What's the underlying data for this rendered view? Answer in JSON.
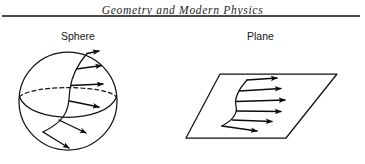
{
  "page": {
    "width": 365,
    "height": 164,
    "background_color": "#ffffff",
    "ink_color": "#111111"
  },
  "running_head": {
    "text": "Geometry and Modern Physics",
    "style": "italic-serif",
    "rule_color": "#4a4a4a"
  },
  "figures": [
    {
      "id": "sphere",
      "label": "Sphere",
      "shape": "circle",
      "has_dashed_equator": true,
      "arrow_count": 6,
      "description": "Sphere with a curve on its surface and normal/tangent arrows"
    },
    {
      "id": "plane",
      "label": "Plane",
      "shape": "parallelogram",
      "has_dashed_equator": false,
      "arrow_count": 6,
      "description": "Parallelogram plane with a curve and arrows pointing right"
    }
  ],
  "diagram_geometry": {
    "sphere": {
      "center_x": 68,
      "center_y": 101,
      "radius": 49
    },
    "plane": {
      "corners": [
        [
          220,
          74
        ],
        [
          337,
          74
        ],
        [
          286,
          138
        ],
        [
          186,
          138
        ]
      ]
    }
  }
}
